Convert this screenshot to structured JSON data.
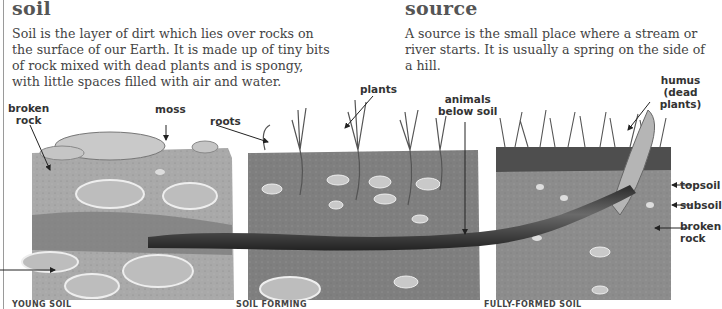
{
  "entries": [
    {
      "title": "soil",
      "text_lines": [
        "Soil is the layer of dirt which lies over rocks on",
        "the surface of our Earth. It is made up of tiny bits",
        "of rock mixed with dead plants and is spongy,",
        "with little spaces filled with air and water."
      ]
    },
    {
      "title": "source",
      "text_lines": [
        "A source is the small place where a stream or",
        "river starts. It is usually a spring on the side of",
        "a hill."
      ]
    }
  ],
  "illustration": {
    "labels": {
      "broken_rock_left": [
        "broken",
        "rock"
      ],
      "moss": "moss",
      "roots": "roots",
      "plants": "plants",
      "animals_below_soil": [
        "animals",
        "below soil"
      ],
      "humus": [
        "humus",
        "(dead plants)"
      ],
      "topsoil": "topsoil",
      "subsoil": "subsoil",
      "broken_rock_right": [
        "broken",
        "rock"
      ]
    },
    "captions": [
      "YOUNG SOIL",
      "SOIL FORMING",
      "FULLY-FORMED SOIL"
    ],
    "colors": {
      "young_soil": "#a9a9a9",
      "forming_soil": "#7f7f7f",
      "topsoil": "#5a5a5a",
      "subsoil": "#8c8c8c",
      "worm": "#3a3a3a",
      "stone": "#c9c9c9"
    }
  }
}
